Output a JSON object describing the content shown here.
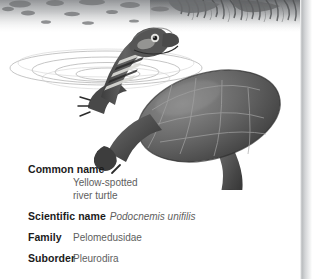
{
  "illustration": {
    "alt_name": "yellow-spotted-river-turtle-illustration",
    "description": "Grayscale pencil illustration of a yellow-spotted river turtle surfacing, head and striped neck raised above the waterline with concentric ripple rings, dark mottled riverbank texture along the top edge",
    "colors": {
      "shell_dark": "#4a4a4a",
      "shell_mid": "#6d6d6d",
      "shell_light": "#8f8f8f",
      "neck_stripe_light": "#d8d8d4",
      "ripple": "#b4b4b4",
      "bank_texture": "#9a9a9a",
      "background": "#ffffff"
    }
  },
  "page_edge": {
    "name": "page-edge-gradient",
    "color": "#c9cbcd"
  },
  "facts": {
    "common_name": {
      "label": "Common name",
      "value_line_1": "Yellow-spotted",
      "value_line_2": "river turtle"
    },
    "scientific_name": {
      "label": "Scientific name",
      "value": "Podocnemis unifilis"
    },
    "family": {
      "label": "Family",
      "value": "Pelomedusidae"
    },
    "suborder": {
      "label": "Suborder",
      "value": "Pleurodira"
    }
  }
}
